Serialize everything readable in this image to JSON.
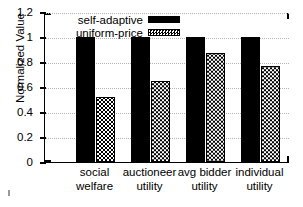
{
  "chart_data": {
    "type": "bar",
    "title": "",
    "xlabel": "",
    "ylabel": "Normalized Value",
    "ylim": [
      0,
      1.2
    ],
    "yticks": [
      "0",
      "0.2",
      "0.4",
      "0.6",
      "0.8",
      "1",
      "1.2"
    ],
    "ytick_values": [
      0,
      0.2,
      0.4,
      0.6,
      0.8,
      1.0,
      1.2
    ],
    "grid": true,
    "legend_position": "top-left-inside",
    "categories": [
      "social welfare",
      "auctioneer utility",
      "avg bidder utility",
      "individual utility"
    ],
    "category_lines": [
      [
        "social",
        "welfare"
      ],
      [
        "auctioneer",
        "utility"
      ],
      [
        "avg bidder",
        "utility"
      ],
      [
        "individual",
        "utility"
      ]
    ],
    "series": [
      {
        "name": "self-adaptive",
        "style": "solid-black",
        "values": [
          1.0,
          1.0,
          1.0,
          1.0
        ]
      },
      {
        "name": "uniform-price",
        "style": "checkered-hatch",
        "values": [
          0.52,
          0.65,
          0.87,
          0.77
        ]
      }
    ]
  },
  "legend": {
    "items": [
      {
        "label": "self-adaptive",
        "swatch": "solid"
      },
      {
        "label": "uniform-price",
        "swatch": "hatch"
      }
    ]
  },
  "colors": {
    "series1": "#000000",
    "series2_fill": "#ffffff",
    "series2_pattern": "#000000",
    "axis": "#000000",
    "grid": "#b4b4b4",
    "background": "#ffffff"
  }
}
